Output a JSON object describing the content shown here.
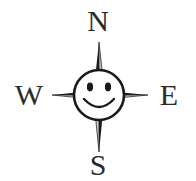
{
  "figure": {
    "kind": "compass-rose-smiley",
    "background_color": "#ffffff",
    "ink_color": "#1a1a1a",
    "label_color": "#2b2b2b",
    "shade_light_color": "#b9b9b9",
    "width": 196,
    "height": 181
  },
  "compass": {
    "center": {
      "x": 99,
      "y": 95
    },
    "face_radius": 25,
    "labels": {
      "north": "N",
      "south": "S",
      "east": "E",
      "west": "W"
    },
    "points": [
      {
        "name": "north",
        "label": "N",
        "tip_x": 99,
        "tip_y": 42,
        "orientation": "up"
      },
      {
        "name": "east",
        "label": "E",
        "tip_x": 148,
        "tip_y": 95,
        "orientation": "right"
      },
      {
        "name": "south",
        "label": "S",
        "tip_x": 99,
        "tip_y": 152,
        "orientation": "down"
      },
      {
        "name": "west",
        "label": "W",
        "tip_x": 52,
        "tip_y": 95,
        "orientation": "left"
      }
    ]
  },
  "face": {
    "expression": "smiling",
    "eyes": [
      {
        "name": "left-eye",
        "cx": 90,
        "cy": 87,
        "rx": 3.1,
        "ry": 4.4
      },
      {
        "name": "right-eye",
        "cx": 108,
        "cy": 87,
        "rx": 3.1,
        "ry": 4.4
      }
    ],
    "mouth": {
      "name": "smile",
      "type": "arc",
      "width": 30,
      "depth": 11
    }
  }
}
